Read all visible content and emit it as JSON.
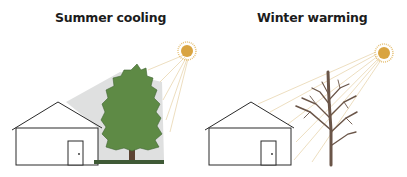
{
  "panels": [
    {
      "title": "Summer cooling",
      "tree": "leafy",
      "sun": true,
      "shade": true
    },
    {
      "title": "Winter warming",
      "tree": "bare",
      "sun": true,
      "shade": false
    }
  ],
  "colors": {
    "sun": "#d9a441",
    "sun_rays": "#e8d3a8",
    "tree_foliage": "#5e8a45",
    "tree_trunk": "#5b4232",
    "bare_tree": "#6a5548",
    "shade": "#d6d8d8",
    "grass": "#3f5a36",
    "house_outline": "#2a2a2a"
  }
}
